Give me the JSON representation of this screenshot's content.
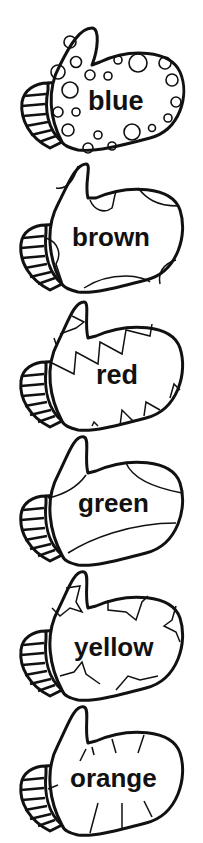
{
  "mittens": [
    {
      "word": "blue",
      "pattern": "circles",
      "top": 20,
      "label_x": 88,
      "label_y": 88,
      "font_size": 27
    },
    {
      "word": "brown",
      "pattern": "patches",
      "top": 158,
      "label_x": 72,
      "label_y": 222,
      "font_size": 26
    },
    {
      "word": "red",
      "pattern": "zigzag",
      "top": 298,
      "label_x": 96,
      "label_y": 360,
      "font_size": 27
    },
    {
      "word": "green",
      "pattern": "stripes",
      "top": 435,
      "label_x": 78,
      "label_y": 490,
      "font_size": 26
    },
    {
      "word": "yellow",
      "pattern": "stars",
      "top": 570,
      "label_x": 74,
      "label_y": 630,
      "font_size": 26
    },
    {
      "word": "orange",
      "pattern": "ticks",
      "top": 705,
      "label_x": 70,
      "label_y": 762,
      "font_size": 26
    }
  ],
  "colors": {
    "ink": "#111111",
    "paper": "#ffffff"
  }
}
